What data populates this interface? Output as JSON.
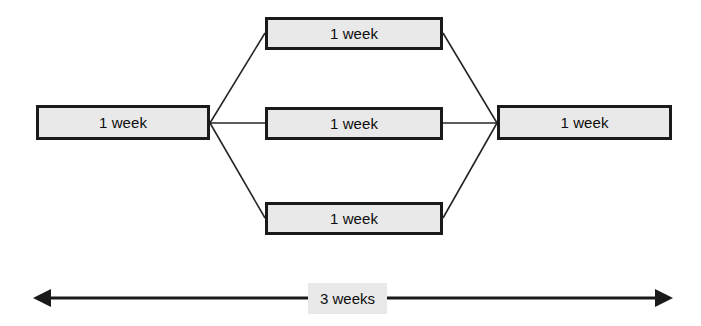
{
  "diagram": {
    "type": "parallel-activity-network",
    "nodes": [
      {
        "id": "start",
        "label": "1 week",
        "x": 36,
        "y": 105,
        "w": 174,
        "h": 35
      },
      {
        "id": "parallel-top",
        "label": "1 week",
        "x": 265,
        "y": 17,
        "w": 178,
        "h": 33
      },
      {
        "id": "parallel-middle",
        "label": "1 week",
        "x": 265,
        "y": 107,
        "w": 178,
        "h": 33
      },
      {
        "id": "parallel-bottom",
        "label": "1 week",
        "x": 265,
        "y": 202,
        "w": 178,
        "h": 33
      },
      {
        "id": "end",
        "label": "1 week",
        "x": 497,
        "y": 105,
        "w": 175,
        "h": 35
      }
    ],
    "edges": [
      {
        "from": "start",
        "to": "parallel-top",
        "x1": 210,
        "y1": 123,
        "x2": 265,
        "y2": 33
      },
      {
        "from": "start",
        "to": "parallel-middle",
        "x1": 210,
        "y1": 123,
        "x2": 265,
        "y2": 123
      },
      {
        "from": "start",
        "to": "parallel-bottom",
        "x1": 210,
        "y1": 123,
        "x2": 265,
        "y2": 218
      },
      {
        "from": "parallel-top",
        "to": "end",
        "x1": 443,
        "y1": 33,
        "x2": 497,
        "y2": 123
      },
      {
        "from": "parallel-middle",
        "to": "end",
        "x1": 443,
        "y1": 123,
        "x2": 497,
        "y2": 123
      },
      {
        "from": "parallel-bottom",
        "to": "end",
        "x1": 443,
        "y1": 218,
        "x2": 497,
        "y2": 123
      }
    ],
    "duration_span": {
      "label": "3 weeks",
      "x_start": 33,
      "x_end": 673,
      "y": 298,
      "arrow_style": "double-headed"
    },
    "colors": {
      "box_fill": "#e9e9e9",
      "box_border": "#1a1a1a",
      "edge_line": "#262626",
      "arrow": "#1a1a1a",
      "text": "#0d0d0d",
      "background": "#ffffff"
    }
  }
}
